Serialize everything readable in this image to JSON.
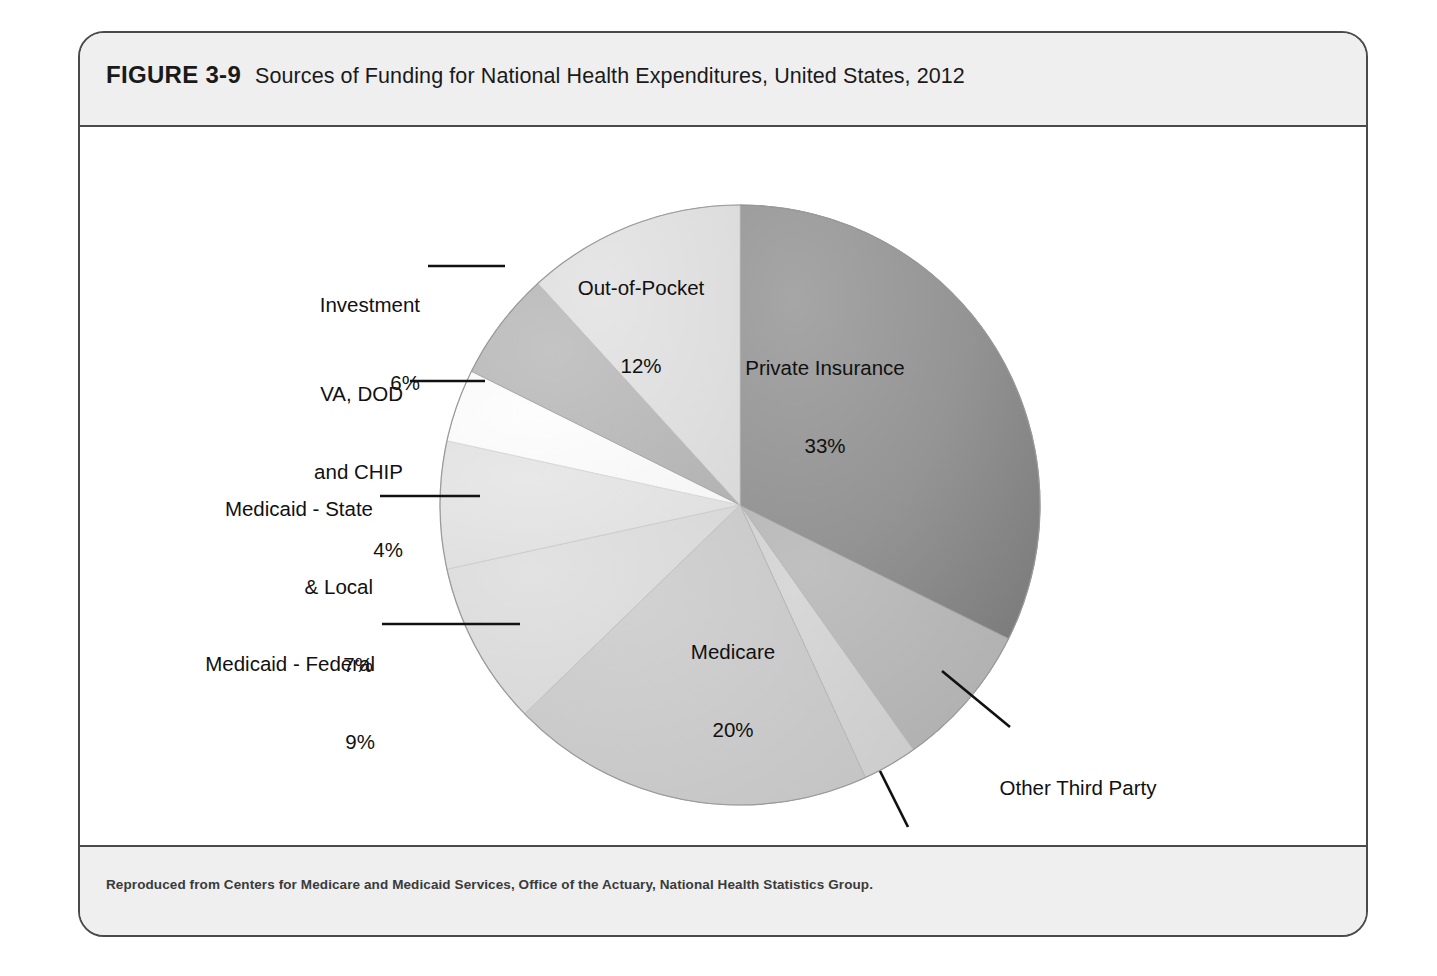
{
  "figure": {
    "number": "FIGURE 3-9",
    "title": "Sources of Funding for National Health Expenditures, United States, 2012",
    "source_note": "Reproduced from Centers for Medicare and Medicaid Services, Office of the Actuary, National Health Statistics Group."
  },
  "chart_data": {
    "type": "pie",
    "title": "Sources of Funding for National Health Expenditures, United States, 2012",
    "xlabel": "",
    "ylabel": "",
    "legend": "none (direct slice labels with leader lines)",
    "grid": false,
    "units": "percent",
    "start_angle_deg": 0,
    "direction": "clockwise",
    "categories": [
      "Private Insurance",
      "Other Third Party Payers & Programs",
      "Government Public Health Activities",
      "Medicare",
      "Medicaid - Federal",
      "Medicaid - State & Local",
      "VA, DOD and CHIP",
      "Investment",
      "Out-of-Pocket"
    ],
    "values": [
      33,
      8,
      3,
      20,
      9,
      7,
      4,
      6,
      12
    ],
    "labels": [
      "Private Insurance\n33%",
      "Other Third Party\nPayers & Programs\n8%",
      "Government Public\nHealth Activities\n3%",
      "Medicare\n20%",
      "Medicaid - Federal\n9%",
      "Medicaid - State\n& Local\n7%",
      "VA, DOD\nand CHIP\n4%",
      "Investment\n6%",
      "Out-of-Pocket\n12%"
    ],
    "colors": [
      "#8e8e8e",
      "#b4b4b4",
      "#d2d2d2",
      "#c9c9c9",
      "#dcdcdc",
      "#e2e2e2",
      "#fbfbfb",
      "#b9b9b9",
      "#dedede"
    ],
    "total": 102
  },
  "slices": {
    "private_insurance": {
      "name": "Private Insurance",
      "pct": "33%",
      "label_l1": "Private Insurance",
      "label_l2": "33%"
    },
    "other_third_party": {
      "name": "Other Third Party Payers & Programs",
      "pct": "8%",
      "label_l1": "Other Third Party",
      "label_l2": "Payers & Programs",
      "label_l3": "8%"
    },
    "gov_public_health": {
      "name": "Government Public Health Activities",
      "pct": "3%",
      "label_l1": "Government Public",
      "label_l2": "Health Activities",
      "label_l3": "3%"
    },
    "medicare": {
      "name": "Medicare",
      "pct": "20%",
      "label_l1": "Medicare",
      "label_l2": "20%"
    },
    "medicaid_federal": {
      "name": "Medicaid - Federal",
      "pct": "9%",
      "label_l1": "Medicaid - Federal",
      "label_l2": "9%"
    },
    "medicaid_state": {
      "name": "Medicaid - State & Local",
      "pct": "7%",
      "label_l1": "Medicaid - State",
      "label_l2": "& Local",
      "label_l3": "7%"
    },
    "va_dod_chip": {
      "name": "VA, DOD and CHIP",
      "pct": "4%",
      "label_l1": "VA, DOD",
      "label_l2": "and CHIP",
      "label_l3": "4%"
    },
    "investment": {
      "name": "Investment",
      "pct": "6%",
      "label_l1": "Investment",
      "label_l2": "6%"
    },
    "out_of_pocket": {
      "name": "Out-of-Pocket",
      "pct": "12%",
      "label_l1": "Out-of-Pocket",
      "label_l2": "12%"
    }
  },
  "colors": {
    "frame_border": "#4a4a4a",
    "band_background": "#efefef",
    "page_background": "#ffffff",
    "text": "#111111",
    "leader_line": "#111111"
  }
}
